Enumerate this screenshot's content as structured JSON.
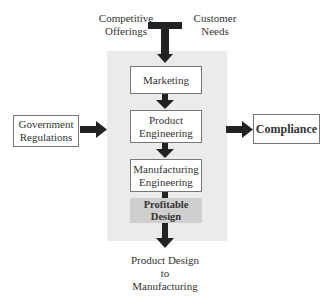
{
  "inputs_top": {
    "left": "Competitive\nOfferings",
    "left_line1": "Competitive",
    "left_line2": "Offerings",
    "right_line1": "Customer",
    "right_line2": "Needs"
  },
  "process": {
    "steps": [
      {
        "line1": "Marketing",
        "line2": ""
      },
      {
        "line1": "Product",
        "line2": "Engineering"
      },
      {
        "line1": "Manufacturing",
        "line2": "Engineering"
      }
    ],
    "result": {
      "line1": "Profitable",
      "line2": "Design"
    }
  },
  "side_input": {
    "line1": "Government",
    "line2": "Regulations"
  },
  "side_output": {
    "label": "Compliance"
  },
  "bottom_output": {
    "line1": "Product Design",
    "line2": "to",
    "line3": "Manufacturing"
  },
  "colors": {
    "panel": "#ebebeb",
    "result_box": "#cfcfcf",
    "arrow": "#222222"
  }
}
